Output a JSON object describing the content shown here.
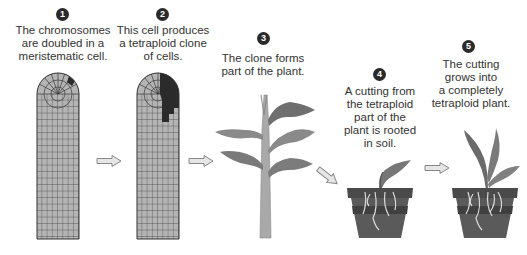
{
  "steps": [
    {
      "number": "1",
      "caption_lines": [
        "The chromosomes",
        "are doubled in a",
        "meristematic cell."
      ]
    },
    {
      "number": "2",
      "caption_lines": [
        "This cell produces",
        "a tetraploid clone",
        "of cells."
      ]
    },
    {
      "number": "3",
      "caption_lines": [
        "The clone forms",
        "part of the plant."
      ]
    },
    {
      "number": "4",
      "caption_lines": [
        "A cutting from",
        "the tetraploid",
        "part of the",
        "plant is rooted",
        "in soil."
      ]
    },
    {
      "number": "5",
      "caption_lines": [
        "The cutting",
        "grows into",
        "a completely",
        "tetraploid plant."
      ]
    }
  ],
  "colors": {
    "cell_fill": "#b4b4b4",
    "tetraploid_fill": "#2b2b2b",
    "grid_line": "#3a3a3a",
    "arrow_fill": "#e6e6e6",
    "arrow_stroke": "#888888",
    "leaf": "#7a7a7a",
    "pot": "#555555"
  }
}
